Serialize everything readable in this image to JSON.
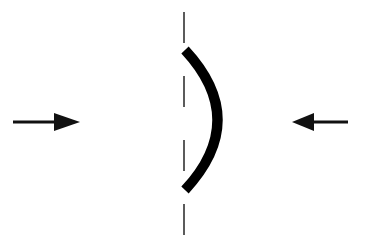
{
  "diagram": {
    "colors": {
      "background": "#ffffff",
      "stroke": "#000000",
      "dash": "#333333"
    },
    "elements": {
      "left_arrow": {
        "direction": "right",
        "x1": 13,
        "x2": 80,
        "y": 122
      },
      "right_arrow": {
        "direction": "left",
        "x1": 348,
        "x2": 292,
        "y": 122
      },
      "center_axis": {
        "x": 184,
        "y1": 12,
        "y2": 236,
        "style": "dashed"
      },
      "curved_element": {
        "top": [
          185,
          50
        ],
        "bottom": [
          185,
          190
        ],
        "bulge_x": 217,
        "stroke_width": 10
      }
    }
  }
}
